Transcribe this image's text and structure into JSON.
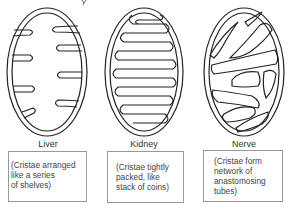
{
  "figure": {
    "title_clipped": "y",
    "panels": [
      {
        "name": "Liver",
        "label": "Liver",
        "description": [
          "(Cristae arranged",
          "like a series",
          "of shelves)"
        ]
      },
      {
        "name": "Kidney",
        "label": "Kidney",
        "description": [
          "(Cristae tightly",
          "packed, like",
          "stack of coins)"
        ]
      },
      {
        "name": "Nerve",
        "label": "Nerve",
        "description": [
          "(Cristae form",
          "network of",
          "anastomosing",
          "tubes)"
        ]
      }
    ],
    "colors": {
      "stroke": "#222222",
      "box_border": "#999999",
      "text": "#444444"
    }
  }
}
